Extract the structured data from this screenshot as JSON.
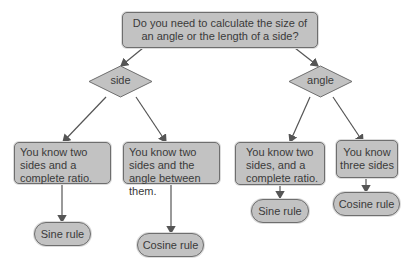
{
  "diagram": {
    "root": "Do you need to calculate the size of an angle or the length of a side?",
    "decisions": {
      "side": "side",
      "angle": "angle"
    },
    "conditions": {
      "side_sine": "You know two sides and a complete ratio.",
      "side_cosine": "You know two sides and the angle between them.",
      "angle_sine": "You know two sides, and a complete ratio.",
      "angle_cosine": "You know three sides"
    },
    "results": {
      "side_sine": "Sine rule",
      "side_cosine": "Cosine rule",
      "angle_sine": "Sine rule",
      "angle_cosine": "Cosine rule"
    },
    "colors": {
      "node_fill": "#c2c2c2",
      "node_border": "#6e6e6e",
      "arrow": "#555555"
    }
  }
}
